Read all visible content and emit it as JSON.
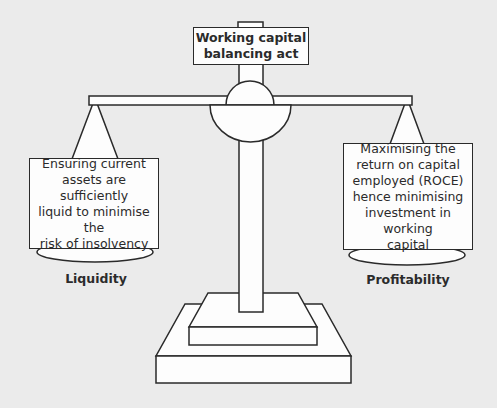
{
  "diagram": {
    "title_lines": [
      "Working capital",
      "balancing act"
    ],
    "left_pan": {
      "text_lines": [
        "Ensuring current",
        "assets are sufficiently",
        "liquid to minimise the",
        "risk of insolvency"
      ],
      "label": "Liquidity"
    },
    "right_pan": {
      "text_lines": [
        "Maximising the",
        "return on capital",
        "employed (ROCE)",
        "hence minimising",
        "investment in working",
        "capital"
      ],
      "label": "Profitability"
    }
  },
  "colors": {
    "background": "#ebebeb",
    "fill": "#fdfdfd",
    "stroke": "#2a2a2a"
  }
}
